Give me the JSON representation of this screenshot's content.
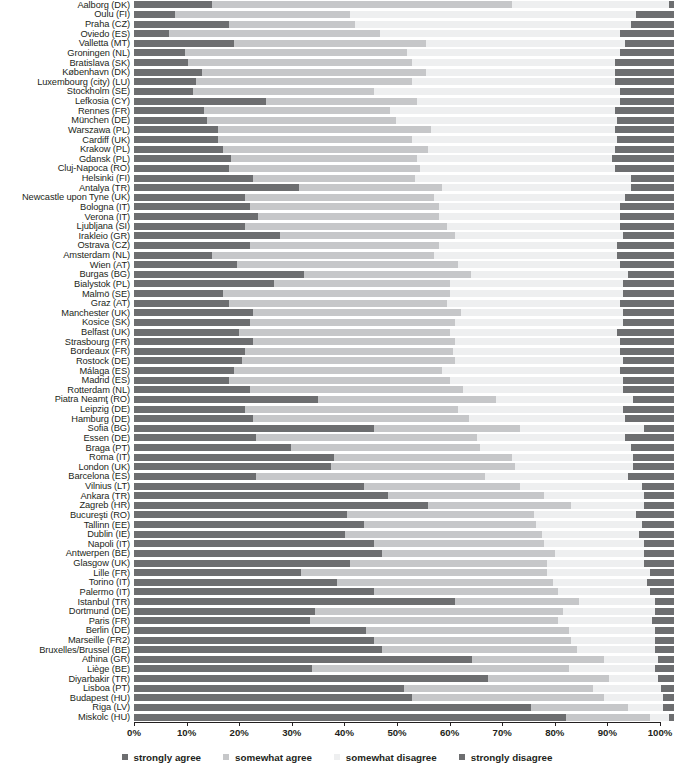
{
  "chart_data": {
    "type": "bar",
    "subtype": "stacked-horizontal-100",
    "title": "",
    "xlabel": "",
    "ylabel": "",
    "xlim": [
      0,
      100
    ],
    "grid": false,
    "legend_position": "bottom",
    "series": [
      {
        "name": "strongly agree",
        "color": "#6d6e70"
      },
      {
        "name": "somewhat agree",
        "color": "#c6c7c9"
      },
      {
        "name": "somewhat disagree",
        "color": "#eeeff0"
      },
      {
        "name": "strongly disagree",
        "color": "#6d6e70"
      }
    ],
    "xticks": [
      "0%",
      "10%",
      "20%",
      "30%",
      "40%",
      "50%",
      "60%",
      "70%",
      "80%",
      "90%",
      "100%"
    ],
    "xtick_values": [
      0,
      10,
      20,
      30,
      40,
      50,
      60,
      70,
      80,
      90,
      100
    ],
    "categories": [
      "Aalborg (DK)",
      "Oulu (FI)",
      "Praha (CZ)",
      "Oviedo (ES)",
      "Valletta (MT)",
      "Groningen (NL)",
      "Bratislava (SK)",
      "København (DK)",
      "Luxembourg (city) (LU)",
      "Stockholm (SE)",
      "Lefkosia (CY)",
      "Rennes (FR)",
      "München (DE)",
      "Warszawa (PL)",
      "Cardiff (UK)",
      "Krakow (PL)",
      "Gdansk (PL)",
      "Cluj-Napoca (RO)",
      "Helsinki (FI)",
      "Antalya (TR)",
      "Newcastle upon Tyne (UK)",
      "Bologna (IT)",
      "Verona (IT)",
      "Ljubljana (SI)",
      "Irakleio (GR)",
      "Ostrava (CZ)",
      "Amsterdam (NL)",
      "Wien (AT)",
      "Burgas (BG)",
      "Bialystok (PL)",
      "Malmö (SE)",
      "Graz (AT)",
      "Manchester (UK)",
      "Kosice (SK)",
      "Belfast (UK)",
      "Strasbourg (FR)",
      "Bordeaux (FR)",
      "Rostock (DE)",
      "Málaga (ES)",
      "Madrid (ES)",
      "Rotterdam (NL)",
      "Piatra Neamţ (RO)",
      "Leipzig (DE)",
      "Hamburg (DE)",
      "Sofia (BG)",
      "Essen (DE)",
      "Braga (PT)",
      "Roma (IT)",
      "London (UK)",
      "Barcelona (ES)",
      "Vilnius (LT)",
      "Ankara (TR)",
      "Zagreb (HR)",
      "Bucureşti (RO)",
      "Tallinn (EE)",
      "Dublin (IE)",
      "Napoli (IT)",
      "Antwerpen (BE)",
      "Glasgow (UK)",
      "Lille (FR)",
      "Torino (IT)",
      "Palermo (IT)",
      "Istanbul (TR)",
      "Dortmund (DE)",
      "Paris (FR)",
      "Berlin (DE)",
      "Marseille (FR2)",
      "Bruxelles/Brussel (BE)",
      "Athina (GR)",
      "Liège (BE)",
      "Diyarbakir (TR)",
      "Lisboa (PT)",
      "Budapest (HU)",
      "Riga (LV)",
      "Miskolc (HU)"
    ],
    "values": [
      [
        14.5,
        55.5,
        29.0,
        1.0
      ],
      [
        7.5,
        32.5,
        53.0,
        7.0
      ],
      [
        17.5,
        23.5,
        51.0,
        8.0
      ],
      [
        6.5,
        39.0,
        44.5,
        10.0
      ],
      [
        18.5,
        35.5,
        37.0,
        9.0
      ],
      [
        9.5,
        41.0,
        39.5,
        10.0
      ],
      [
        10.0,
        41.5,
        37.5,
        11.0
      ],
      [
        12.5,
        41.5,
        35.0,
        11.0
      ],
      [
        11.5,
        40.0,
        37.5,
        11.0
      ],
      [
        11.0,
        33.5,
        45.5,
        10.0
      ],
      [
        24.5,
        28.0,
        37.5,
        10.0
      ],
      [
        13.0,
        34.5,
        41.5,
        11.0
      ],
      [
        13.5,
        35.0,
        41.0,
        10.5
      ],
      [
        15.5,
        39.5,
        34.0,
        11.0
      ],
      [
        15.5,
        36.0,
        38.0,
        10.5
      ],
      [
        16.5,
        38.0,
        34.5,
        11.0
      ],
      [
        18.0,
        34.5,
        36.0,
        11.5
      ],
      [
        17.5,
        35.5,
        36.0,
        11.0
      ],
      [
        22.0,
        30.0,
        40.0,
        8.0
      ],
      [
        30.5,
        26.5,
        35.0,
        8.0
      ],
      [
        20.5,
        35.0,
        35.5,
        9.0
      ],
      [
        21.5,
        35.0,
        33.5,
        10.0
      ],
      [
        23.0,
        33.5,
        33.5,
        10.0
      ],
      [
        20.5,
        37.5,
        32.0,
        10.0
      ],
      [
        27.0,
        32.5,
        31.0,
        9.5
      ],
      [
        21.5,
        35.0,
        33.0,
        10.5
      ],
      [
        14.5,
        41.0,
        34.0,
        10.5
      ],
      [
        19.0,
        41.0,
        30.0,
        10.0
      ],
      [
        31.5,
        31.0,
        29.0,
        8.5
      ],
      [
        26.0,
        32.5,
        32.0,
        9.5
      ],
      [
        16.5,
        42.0,
        32.0,
        9.5
      ],
      [
        17.5,
        40.5,
        32.0,
        10.0
      ],
      [
        22.0,
        38.5,
        30.0,
        9.5
      ],
      [
        21.5,
        38.0,
        31.0,
        9.5
      ],
      [
        19.5,
        39.0,
        31.0,
        10.5
      ],
      [
        22.0,
        37.5,
        30.5,
        10.0
      ],
      [
        20.5,
        38.5,
        31.0,
        10.0
      ],
      [
        20.0,
        39.5,
        31.0,
        9.5
      ],
      [
        18.5,
        38.5,
        33.0,
        10.0
      ],
      [
        17.5,
        41.0,
        32.0,
        9.5
      ],
      [
        21.5,
        39.5,
        29.5,
        9.5
      ],
      [
        34.0,
        33.0,
        25.5,
        7.5
      ],
      [
        20.5,
        39.5,
        30.5,
        9.5
      ],
      [
        22.0,
        40.0,
        29.0,
        9.0
      ],
      [
        44.5,
        27.0,
        23.0,
        5.5
      ],
      [
        22.5,
        41.0,
        27.5,
        9.0
      ],
      [
        29.0,
        35.0,
        28.0,
        8.0
      ],
      [
        37.0,
        33.0,
        22.5,
        7.5
      ],
      [
        36.5,
        34.0,
        22.0,
        7.5
      ],
      [
        22.5,
        42.5,
        26.5,
        8.5
      ],
      [
        42.5,
        29.0,
        22.5,
        6.0
      ],
      [
        47.0,
        29.0,
        18.5,
        5.5
      ],
      [
        54.5,
        26.5,
        13.5,
        5.5
      ],
      [
        39.5,
        34.5,
        19.0,
        7.0
      ],
      [
        42.5,
        32.0,
        19.5,
        6.0
      ],
      [
        39.0,
        36.5,
        18.0,
        6.5
      ],
      [
        44.5,
        31.5,
        18.5,
        5.5
      ],
      [
        46.0,
        32.0,
        16.5,
        5.5
      ],
      [
        40.0,
        36.5,
        18.0,
        5.5
      ],
      [
        31.0,
        45.5,
        19.0,
        4.5
      ],
      [
        37.5,
        40.0,
        17.5,
        5.0
      ],
      [
        44.5,
        34.0,
        17.0,
        4.5
      ],
      [
        59.5,
        23.0,
        14.0,
        3.5
      ],
      [
        33.5,
        46.0,
        17.0,
        3.5
      ],
      [
        32.5,
        46.0,
        17.5,
        4.0
      ],
      [
        43.0,
        37.5,
        16.0,
        3.5
      ],
      [
        44.5,
        36.5,
        15.5,
        3.5
      ],
      [
        46.0,
        36.0,
        14.5,
        3.5
      ],
      [
        62.5,
        24.5,
        10.0,
        3.0
      ],
      [
        33.0,
        47.5,
        16.0,
        3.5
      ],
      [
        65.5,
        22.5,
        9.0,
        3.0
      ],
      [
        50.0,
        35.0,
        12.5,
        2.5
      ],
      [
        51.5,
        35.5,
        11.0,
        2.0
      ],
      [
        73.5,
        18.0,
        6.5,
        2.0
      ],
      [
        80.0,
        15.5,
        3.5,
        1.0
      ]
    ]
  }
}
